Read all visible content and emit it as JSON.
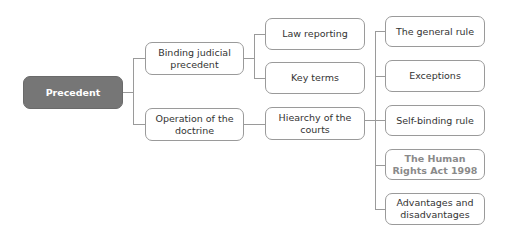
{
  "diagram": {
    "root": {
      "label": "Precedent"
    },
    "level1": [
      {
        "label": "Binding judicial precedent"
      },
      {
        "label": "Operation of the doctrine"
      }
    ],
    "level2": [
      {
        "label": "Law reporting",
        "parent": "Binding judicial precedent"
      },
      {
        "label": "Key terms",
        "parent": "Binding judicial precedent"
      },
      {
        "label": "Hiearchy of the courts",
        "parent": "Operation of the doctrine"
      }
    ],
    "level3": [
      {
        "label": "The general rule",
        "parent": "Hiearchy of the courts"
      },
      {
        "label": "Exceptions",
        "parent": "Hiearchy of the courts"
      },
      {
        "label": "Self-binding rule",
        "parent": "Hiearchy of the courts"
      },
      {
        "label": "The Human Rights Act 1998",
        "parent": "Hiearchy of the courts",
        "muted": true
      },
      {
        "label": "Advantages and disadvantages",
        "parent": "Hiearchy of the courts"
      }
    ],
    "colors": {
      "root_fill": "#767676",
      "border": "#9a9a9a",
      "text": "#333333",
      "muted_text": "#8a8a8a"
    }
  }
}
